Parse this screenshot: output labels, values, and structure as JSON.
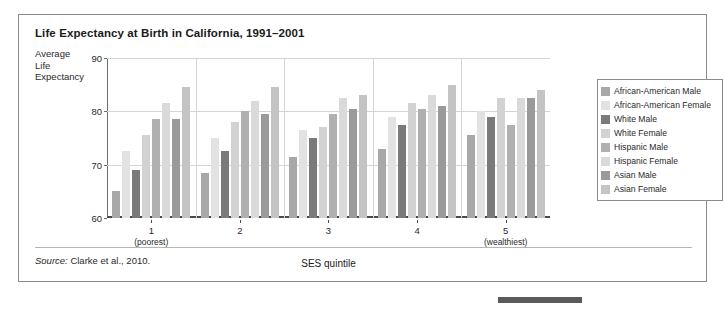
{
  "figure": {
    "title": "Life Expectancy at Birth in California, 1991–2001",
    "y_axis_title": "Average Life Expectancy",
    "y_axis_title_lines": [
      "Average",
      "Life",
      "Expectancy"
    ],
    "source_prefix": "Source:",
    "source_text": " Clarke et al., 2010."
  },
  "chart_data": {
    "type": "bar",
    "title": "Life Expectancy at Birth in California, 1991–2001",
    "xlabel": "SES quintile",
    "ylabel": "Average Life Expectancy",
    "ylim": [
      60,
      90
    ],
    "yticks": [
      60,
      70,
      80,
      90
    ],
    "grid": true,
    "legend_position": "right",
    "categories": [
      "1",
      "2",
      "3",
      "4",
      "5"
    ],
    "category_sublabels": [
      "(poorest)",
      "",
      "",
      "",
      "(wealthiest)"
    ],
    "series": [
      {
        "name": "African-American Male",
        "color": "#a8a8a8",
        "values": [
          65.0,
          68.5,
          71.5,
          73.0,
          75.5
        ]
      },
      {
        "name": "African-American Female",
        "color": "#e2e2e2",
        "values": [
          72.5,
          75.0,
          76.5,
          79.0,
          80.0
        ]
      },
      {
        "name": "White Male",
        "color": "#7a7a7a",
        "values": [
          69.0,
          72.5,
          75.0,
          77.5,
          79.0
        ]
      },
      {
        "name": "White Female",
        "color": "#d2d2d2",
        "values": [
          75.5,
          78.0,
          77.0,
          81.5,
          82.5
        ]
      },
      {
        "name": "Hispanic Male",
        "color": "#b0b0b0",
        "values": [
          78.5,
          80.0,
          79.5,
          80.5,
          77.5
        ]
      },
      {
        "name": "Hispanic Female",
        "color": "#dadada",
        "values": [
          81.5,
          82.0,
          82.5,
          83.0,
          82.5
        ]
      },
      {
        "name": "Asian Male",
        "color": "#9a9a9a",
        "values": [
          78.5,
          79.5,
          80.5,
          81.0,
          82.5
        ]
      },
      {
        "name": "Asian Female",
        "color": "#c4c4c4",
        "values": [
          84.5,
          84.5,
          83.0,
          85.0,
          84.0
        ]
      }
    ]
  }
}
